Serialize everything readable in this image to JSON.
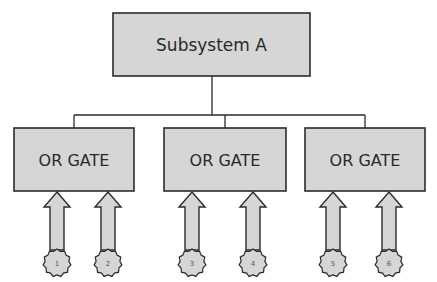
{
  "colors": {
    "box_fill": "#d6d6d6",
    "stroke": "#2b2b2b",
    "text": "#2a2a2a",
    "background": "#ffffff"
  },
  "top": {
    "label": "Subsystem A",
    "x": 113,
    "y": 13,
    "w": 197,
    "h": 63
  },
  "connector": {
    "stem_x": 212,
    "stem_top": 76,
    "bar_y": 115,
    "bar_left": 74,
    "bar_right": 365
  },
  "gates": [
    {
      "label": "OR GATE",
      "x": 14,
      "y": 128,
      "w": 120,
      "h": 63,
      "drop_x": 74,
      "inputs": [
        {
          "id": "1",
          "cx": 57
        },
        {
          "id": "2",
          "cx": 108
        }
      ]
    },
    {
      "label": "OR GATE",
      "x": 164,
      "y": 128,
      "w": 122,
      "h": 63,
      "drop_x": 225,
      "inputs": [
        {
          "id": "3",
          "cx": 192
        },
        {
          "id": "4",
          "cx": 253
        }
      ]
    },
    {
      "label": "OR GATE",
      "x": 305,
      "y": 128,
      "w": 120,
      "h": 63,
      "drop_x": 365,
      "inputs": [
        {
          "id": "5",
          "cx": 333
        },
        {
          "id": "6",
          "cx": 389
        }
      ]
    }
  ],
  "arrow": {
    "top": 192,
    "bottom": 250,
    "head_h": 15,
    "head_w": 13,
    "shaft_w": 7
  },
  "starburst": {
    "cy": 263,
    "r_outer": 14,
    "r_inner": 12,
    "points": 11
  }
}
